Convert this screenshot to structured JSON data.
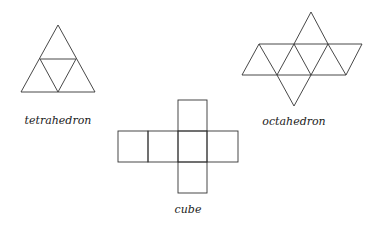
{
  "figures": [
    {
      "name": "tetrahedron",
      "label": "tetrahedron",
      "net_faces": 4,
      "vertices": {
        "apex": [
          58,
          25
        ],
        "left": [
          21,
          92
        ],
        "right": [
          95,
          92
        ],
        "mid_left": [
          40,
          59
        ],
        "mid_right": [
          76,
          59
        ],
        "mid_base": [
          58,
          92
        ]
      },
      "label_pos": [
        58,
        124
      ]
    },
    {
      "name": "octahedron",
      "label": "octahedron",
      "net_faces": 8,
      "label_pos": [
        294,
        125
      ]
    },
    {
      "name": "cube",
      "label": "cube",
      "net_faces": 6,
      "label_pos": [
        188,
        213
      ]
    }
  ],
  "colors": {
    "stroke": "#333333",
    "text": "#222222",
    "background": "#ffffff"
  }
}
